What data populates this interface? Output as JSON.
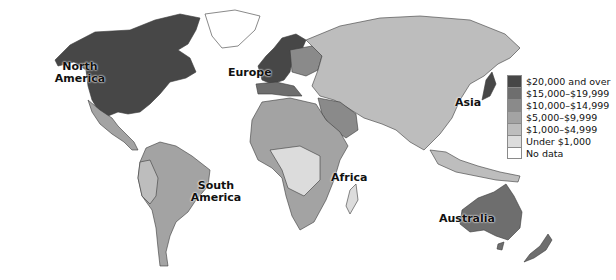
{
  "map": {
    "type": "choropleth-world-map",
    "subject": "GDP per capita",
    "region_labels": {
      "north_america": "North America",
      "europe": "Europe",
      "asia": "Asia",
      "africa": "Africa",
      "south_america": "South America",
      "australia": "Australia"
    },
    "legend": [
      {
        "label": "$20,000 and over",
        "color": "#474747"
      },
      {
        "label": "$15,000–$19,999",
        "color": "#6e6e6e"
      },
      {
        "label": "$10,000–$14,999",
        "color": "#8a8a8a"
      },
      {
        "label": "$5,000–$9,999",
        "color": "#a3a3a3"
      },
      {
        "label": "$1,000–$4,999",
        "color": "#bdbdbd"
      },
      {
        "label": "Under $1,000",
        "color": "#dcdcdc"
      },
      {
        "label": "No data",
        "color": "#ffffff"
      }
    ]
  }
}
